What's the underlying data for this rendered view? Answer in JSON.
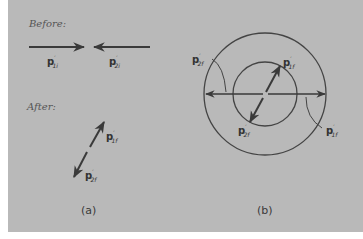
{
  "figure": {
    "panel_a": {
      "before_heading": "Before:",
      "after_heading": "After:",
      "caption": "(a)",
      "labels": {
        "p1i": {
          "base": "p",
          "prime": "′",
          "sub": "1i"
        },
        "p2i": {
          "base": "p",
          "prime": "′",
          "sub": "2i"
        },
        "p1f": {
          "base": "p",
          "prime": "′",
          "sub": "1f"
        },
        "p2f": {
          "base": "p",
          "prime": "′",
          "sub": "2f"
        }
      }
    },
    "panel_b": {
      "caption": "(b)",
      "labels": {
        "p2f_outer": {
          "base": "p",
          "prime": "′",
          "sub": "2f"
        },
        "p1f_inner": {
          "base": "p",
          "prime": "′",
          "sub": "1f"
        },
        "p2f_inner": {
          "base": "p",
          "prime": "′",
          "sub": "2f"
        },
        "p1f_outer": {
          "base": "p",
          "prime": "′",
          "sub": "1f"
        }
      }
    },
    "colors": {
      "background": "#b9b9b9",
      "ink": "#3a3a3a"
    }
  }
}
